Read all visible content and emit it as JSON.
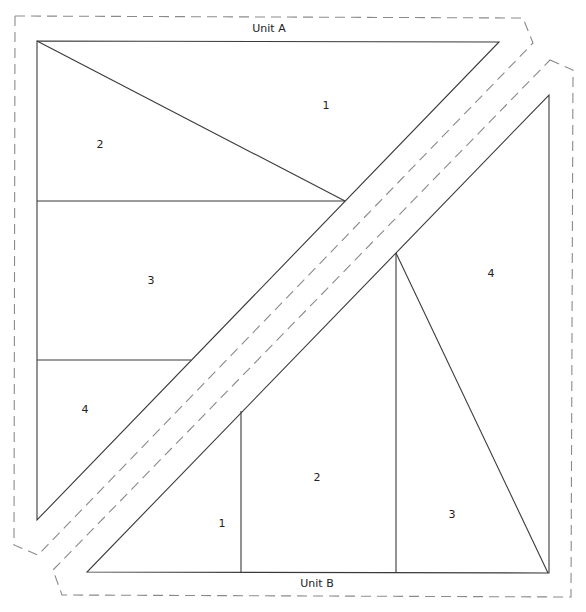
{
  "diagram": {
    "type": "foundation-paper-piecing-pattern",
    "units": [
      {
        "name": "Unit A",
        "label_pos": [
          269,
          29
        ],
        "outline_dashed": [
          [
            15,
            16
          ],
          [
            523,
            18
          ],
          [
            533,
            43
          ],
          [
            38,
            555
          ],
          [
            14,
            545
          ]
        ],
        "outer_triangle": [
          [
            37,
            41
          ],
          [
            499,
            42
          ],
          [
            37,
            520
          ]
        ],
        "seams": [
          [
            [
              37,
              41
            ],
            [
              345,
              201
            ]
          ],
          [
            [
              37,
              201
            ],
            [
              345,
              201
            ]
          ],
          [
            [
              37,
              360
            ],
            [
              191,
              360
            ]
          ]
        ],
        "pieces": [
          {
            "number": "1",
            "pos": [
              326,
              106
            ]
          },
          {
            "number": "2",
            "pos": [
              100,
              145
            ]
          },
          {
            "number": "3",
            "pos": [
              151,
              281
            ]
          },
          {
            "number": "4",
            "pos": [
              85,
              410
            ]
          }
        ]
      },
      {
        "name": "Unit B",
        "label_pos": [
          317,
          584
        ],
        "outline_dashed": [
          [
            550,
            60
          ],
          [
            573,
            70
          ],
          [
            571,
            597
          ],
          [
            62,
            595
          ],
          [
            53,
            570
          ]
        ],
        "outer_triangle": [
          [
            549,
            95
          ],
          [
            549,
            573
          ],
          [
            87,
            572
          ]
        ],
        "seams": [
          [
            [
              241,
              411
            ],
            [
              241,
              573
            ]
          ],
          [
            [
              396,
              253
            ],
            [
              396,
              573
            ]
          ],
          [
            [
              396,
              253
            ],
            [
              548,
              573
            ]
          ]
        ],
        "pieces": [
          {
            "number": "1",
            "pos": [
              222,
              524
            ]
          },
          {
            "number": "2",
            "pos": [
              317,
              478
            ]
          },
          {
            "number": "3",
            "pos": [
              452,
              515
            ]
          },
          {
            "number": "4",
            "pos": [
              491,
              274
            ]
          }
        ]
      }
    ],
    "colors": {
      "seam_line": "#3a3a3a",
      "cut_line": "#8a8a8a",
      "background": "#ffffff"
    }
  }
}
